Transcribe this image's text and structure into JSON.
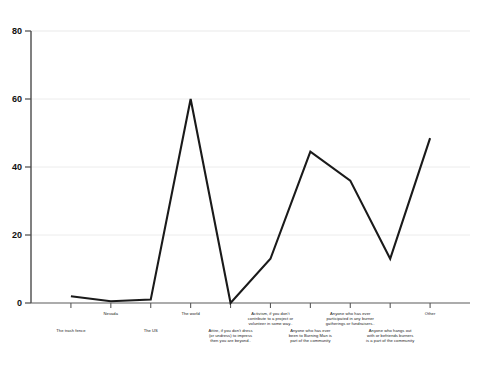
{
  "chart_data": {
    "type": "line",
    "title": "",
    "xlabel": "",
    "ylabel": "",
    "ylim": [
      0,
      80
    ],
    "yticks": [
      0,
      20,
      40,
      60,
      80
    ],
    "grid": true,
    "legend": "none",
    "categories": [
      "The trash fence",
      "Nevada",
      "The US",
      "The world",
      "Attire, if you don't dress (or undress) to impress then you are beyond..",
      "Activism, if you don't contribute to a project or volunteer in some way..",
      "Anyone who has ever been to Burning Man is part of the community",
      "Anyone who has ever participated in any burner gatherings or fundraisers..",
      "Anyone who hangs out with or befriends burners is a part of the community",
      "Other"
    ],
    "values": [
      2,
      0.5,
      1,
      60,
      0,
      13,
      44.5,
      36,
      13,
      48.5
    ],
    "series": [
      {
        "name": "Responses",
        "values": [
          2,
          0.5,
          1,
          60,
          0,
          13,
          44.5,
          36,
          13,
          48.5
        ]
      }
    ],
    "line_color": "#1a1a1a",
    "grid_color": "#e8e8e8",
    "axis_color": "#555555"
  },
  "axis": {
    "ytick_labels": [
      "0",
      "20",
      "40",
      "60",
      "80"
    ]
  },
  "xlabels": [
    {
      "text": "The trash fence",
      "row": "b"
    },
    {
      "text": "Nevada",
      "row": "a"
    },
    {
      "text": "The US",
      "row": "b"
    },
    {
      "text": "The world",
      "row": "a"
    },
    {
      "text": "Attire, if you don't dress\n(or undress) to impress\nthen you are beyond..",
      "row": "b"
    },
    {
      "text": "Activism, if you don't\ncontribute to a project or\nvolunteer in some way..",
      "row": "a"
    },
    {
      "text": "Anyone who has ever\nbeen to Burning Man is\npart of the community",
      "row": "b"
    },
    {
      "text": "Anyone who has ever\nparticipated in any burner\ngatherings or fundraisers..",
      "row": "a"
    },
    {
      "text": "Anyone who hangs out\nwith or befriends burners\nis a part of the community",
      "row": "b"
    },
    {
      "text": "Other",
      "row": "a"
    }
  ]
}
